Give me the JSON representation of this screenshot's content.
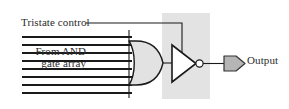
{
  "diagram": {
    "labels": {
      "tristate_control": "Tristate control",
      "from_and_line1": "From AND",
      "from_and_line2": "gate array",
      "output": "Output"
    },
    "colors": {
      "line": "#1a1a1a",
      "gate_fill": "#e2e2e2",
      "shade_box": "#e3e3e3",
      "pad_fill": "#b5b5b5",
      "text": "#2b2b2b",
      "background": "#ffffff"
    },
    "components": [
      {
        "name": "or-gate",
        "type": "OR",
        "input_count": 8,
        "label": ""
      },
      {
        "name": "inverter",
        "type": "NOT",
        "label": "",
        "has_bubble": true
      },
      {
        "name": "output-pad",
        "type": "pad",
        "label": "Output"
      },
      {
        "name": "shaded-region",
        "type": "highlight-box",
        "label": ""
      }
    ],
    "wires": [
      {
        "name": "tristate-control-wire",
        "from": "Tristate control",
        "to": "inverter"
      },
      {
        "name": "or-gate-output-wire",
        "from": "or-gate",
        "to": "inverter"
      },
      {
        "name": "inverter-output-wire",
        "from": "inverter",
        "to": "output-pad"
      },
      {
        "name": "and-array-input-bus",
        "from": "From AND gate array",
        "to": "or-gate"
      }
    ]
  }
}
